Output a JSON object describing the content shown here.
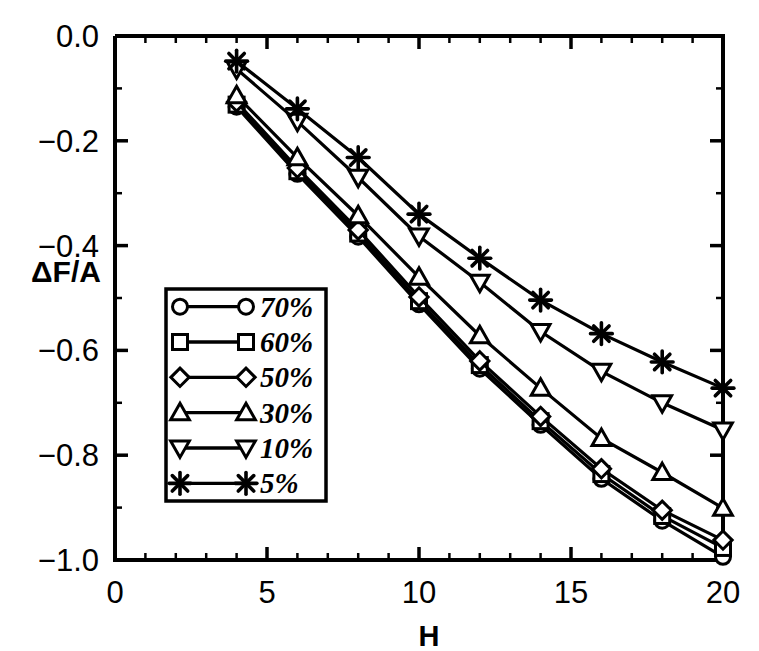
{
  "chart_data": {
    "type": "line",
    "title": "",
    "subtitle": "",
    "xlabel": "H",
    "ylabel": "ΔF/A",
    "xlim": [
      0,
      20
    ],
    "ylim": [
      -1.0,
      0.0
    ],
    "x_ticks": [
      0,
      5,
      10,
      15,
      20
    ],
    "x_tick_labels": [
      "0",
      "5",
      "10",
      "15",
      "20"
    ],
    "x_minor_step": 1,
    "y_ticks": [
      0.0,
      -0.2,
      -0.4,
      -0.6,
      -0.8,
      -1.0
    ],
    "y_tick_labels": [
      "0.0",
      "-0.2",
      "-0.4",
      "-0.6",
      "-0.8",
      "-1.0"
    ],
    "y_minor_step": 0.1,
    "grid": false,
    "legend_position": "center-left-inside",
    "x": [
      4,
      6,
      8,
      10,
      12,
      14,
      16,
      18,
      20
    ],
    "series": [
      {
        "name": "70%",
        "marker": "circle-open",
        "values": [
          -0.135,
          -0.263,
          -0.383,
          -0.512,
          -0.635,
          -0.742,
          -0.845,
          -0.925,
          -0.994
        ]
      },
      {
        "name": "60%",
        "marker": "square-open",
        "values": [
          -0.131,
          -0.258,
          -0.377,
          -0.506,
          -0.628,
          -0.735,
          -0.836,
          -0.916,
          -0.977
        ]
      },
      {
        "name": "50%",
        "marker": "diamond-open",
        "values": [
          -0.126,
          -0.252,
          -0.37,
          -0.498,
          -0.62,
          -0.726,
          -0.826,
          -0.905,
          -0.962
        ]
      },
      {
        "name": "30%",
        "marker": "triangle-up-open",
        "values": [
          -0.114,
          -0.232,
          -0.343,
          -0.46,
          -0.572,
          -0.672,
          -0.768,
          -0.833,
          -0.901
        ]
      },
      {
        "name": "10%",
        "marker": "triangle-down-open",
        "values": [
          -0.063,
          -0.163,
          -0.27,
          -0.382,
          -0.47,
          -0.564,
          -0.64,
          -0.7,
          -0.752
        ]
      },
      {
        "name": "5%",
        "marker": "asterisk-solid",
        "values": [
          -0.048,
          -0.139,
          -0.232,
          -0.34,
          -0.424,
          -0.504,
          -0.568,
          -0.622,
          -0.672
        ]
      }
    ]
  },
  "legend": {
    "entries": [
      {
        "label": "70%",
        "marker": "circle-open"
      },
      {
        "label": "60%",
        "marker": "square-open"
      },
      {
        "label": "50%",
        "marker": "diamond-open"
      },
      {
        "label": "30%",
        "marker": "triangle-up-open"
      },
      {
        "label": "10%",
        "marker": "triangle-down-open"
      },
      {
        "label": "5%",
        "marker": "asterisk-solid"
      }
    ]
  },
  "axes": {
    "y_axis_title": "ΔF/A",
    "x_axis_title": "H"
  }
}
